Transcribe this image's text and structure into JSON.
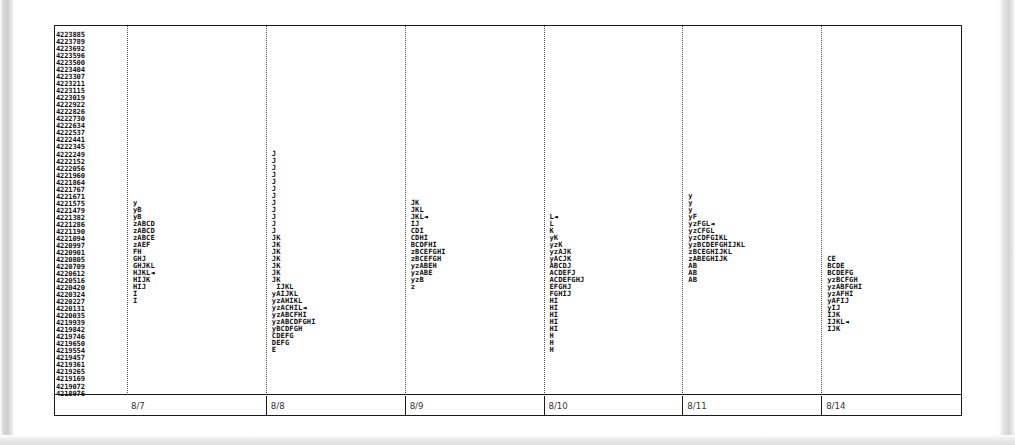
{
  "chart_data": {
    "type": "scatter",
    "title": "",
    "subtitle": "",
    "xlabel": "",
    "ylabel": "",
    "grid": "dotted-vertical",
    "legend": "none",
    "categories": [
      "8/7",
      "8/8",
      "8/9",
      "8/10",
      "8/11",
      "8/14"
    ],
    "y_axis": {
      "type": "numeric-descending",
      "min": 4180014,
      "max": 4223885,
      "step": -96,
      "tick_count": 52,
      "ticks": [
        "4223885",
        "4223789",
        "4223692",
        "4223596",
        "4223500",
        "4223404",
        "4223307",
        "4223211",
        "4223115",
        "4223019",
        "4222922",
        "4222826",
        "4222730",
        "4222634",
        "4222537",
        "4222441",
        "4222345",
        "4222249",
        "4222152",
        "4222056",
        "4221960",
        "4221864",
        "4221767",
        "4221671",
        "4221575",
        "4221479",
        "4221382",
        "4221286",
        "4221190",
        "4221094",
        "4220997",
        "4220901",
        "4220805",
        "4220709",
        "4220612",
        "4220516",
        "4220420",
        "4220324",
        "4220227",
        "4220131",
        "4220035",
        "4219939",
        "4219842",
        "4219746",
        "4219650",
        "4219554",
        "4219457",
        "4219361",
        "4219265",
        "4219169",
        "4219072",
        "4218976",
        "4218880",
        "4218784",
        "4218687",
        "4218591",
        "4218495",
        "4218399",
        "4218302",
        "4218206",
        "4218110",
        "4218014"
      ]
    },
    "marker_note": "◄ arrow marker denotes flagged row",
    "series": [
      {
        "name": "8/7",
        "column_index": 0,
        "points": [
          {
            "row": 24,
            "code": "y"
          },
          {
            "row": 25,
            "code": "yB"
          },
          {
            "row": 26,
            "code": "yB"
          },
          {
            "row": 27,
            "code": "zABCD"
          },
          {
            "row": 28,
            "code": "zABCD"
          },
          {
            "row": 29,
            "code": "zABCE"
          },
          {
            "row": 30,
            "code": "zAEF"
          },
          {
            "row": 31,
            "code": "FH"
          },
          {
            "row": 32,
            "code": "GHJ"
          },
          {
            "row": 33,
            "code": "GHJKL"
          },
          {
            "row": 34,
            "code": "HJKL◄"
          },
          {
            "row": 35,
            "code": "HIJK"
          },
          {
            "row": 36,
            "code": "HIJ"
          },
          {
            "row": 37,
            "code": "I"
          },
          {
            "row": 38,
            "code": "I"
          }
        ]
      },
      {
        "name": "8/8",
        "column_index": 1,
        "points": [
          {
            "row": 17,
            "code": "J"
          },
          {
            "row": 18,
            "code": "J"
          },
          {
            "row": 19,
            "code": "J"
          },
          {
            "row": 20,
            "code": "J"
          },
          {
            "row": 21,
            "code": "J"
          },
          {
            "row": 22,
            "code": "J"
          },
          {
            "row": 23,
            "code": "J"
          },
          {
            "row": 24,
            "code": "J"
          },
          {
            "row": 25,
            "code": "J"
          },
          {
            "row": 26,
            "code": "J"
          },
          {
            "row": 27,
            "code": "J"
          },
          {
            "row": 28,
            "code": "J"
          },
          {
            "row": 29,
            "code": "JK"
          },
          {
            "row": 30,
            "code": "JK"
          },
          {
            "row": 31,
            "code": "JK"
          },
          {
            "row": 32,
            "code": "JK"
          },
          {
            "row": 33,
            "code": "JK"
          },
          {
            "row": 34,
            "code": "JK"
          },
          {
            "row": 35,
            "code": "JK"
          },
          {
            "row": 36,
            "code": " IJKL"
          },
          {
            "row": 37,
            "code": "yAIJKL"
          },
          {
            "row": 38,
            "code": "yzAHIKL"
          },
          {
            "row": 39,
            "code": "yzACHIL◄"
          },
          {
            "row": 40,
            "code": "yzABCFHI"
          },
          {
            "row": 41,
            "code": "yzABCDFGHI"
          },
          {
            "row": 42,
            "code": "yBCDFGH"
          },
          {
            "row": 43,
            "code": "CDEFG"
          },
          {
            "row": 44,
            "code": "DEFG"
          },
          {
            "row": 45,
            "code": "E"
          }
        ]
      },
      {
        "name": "8/9",
        "column_index": 2,
        "points": [
          {
            "row": 24,
            "code": "JK"
          },
          {
            "row": 25,
            "code": "JKL"
          },
          {
            "row": 26,
            "code": "JKL◄"
          },
          {
            "row": 27,
            "code": "IJ"
          },
          {
            "row": 28,
            "code": "CDI"
          },
          {
            "row": 29,
            "code": "CDHI"
          },
          {
            "row": 30,
            "code": "BCDFHI"
          },
          {
            "row": 31,
            "code": "zBCEFGHI"
          },
          {
            "row": 32,
            "code": "zBCEFGH"
          },
          {
            "row": 33,
            "code": "yzABEH"
          },
          {
            "row": 34,
            "code": "yzABE"
          },
          {
            "row": 35,
            "code": "yzB"
          },
          {
            "row": 36,
            "code": "z"
          }
        ]
      },
      {
        "name": "8/10",
        "column_index": 3,
        "points": [
          {
            "row": 26,
            "code": "L◄"
          },
          {
            "row": 27,
            "code": "L"
          },
          {
            "row": 28,
            "code": "K"
          },
          {
            "row": 29,
            "code": "yK"
          },
          {
            "row": 30,
            "code": "yzK"
          },
          {
            "row": 31,
            "code": "yzAJK"
          },
          {
            "row": 32,
            "code": "yACJK"
          },
          {
            "row": 33,
            "code": "ABCDJ"
          },
          {
            "row": 34,
            "code": "ACDEFJ"
          },
          {
            "row": 35,
            "code": "ACDEFGHJ"
          },
          {
            "row": 36,
            "code": "EFGHJ"
          },
          {
            "row": 37,
            "code": "FGHIJ"
          },
          {
            "row": 38,
            "code": "HI"
          },
          {
            "row": 39,
            "code": "HI"
          },
          {
            "row": 40,
            "code": "HI"
          },
          {
            "row": 41,
            "code": "HI"
          },
          {
            "row": 42,
            "code": "HI"
          },
          {
            "row": 43,
            "code": "H"
          },
          {
            "row": 44,
            "code": "H"
          },
          {
            "row": 45,
            "code": "H"
          }
        ]
      },
      {
        "name": "8/11",
        "column_index": 4,
        "points": [
          {
            "row": 23,
            "code": "y"
          },
          {
            "row": 24,
            "code": "y"
          },
          {
            "row": 25,
            "code": "y"
          },
          {
            "row": 26,
            "code": "yF"
          },
          {
            "row": 27,
            "code": "yzFGL◄"
          },
          {
            "row": 28,
            "code": "yzCFGL"
          },
          {
            "row": 29,
            "code": "yzCDFGIKL"
          },
          {
            "row": 30,
            "code": "yzBCDEFGHIJKL"
          },
          {
            "row": 31,
            "code": "zBCEGHIJKL"
          },
          {
            "row": 32,
            "code": "zABEGHIJK"
          },
          {
            "row": 33,
            "code": "AB"
          },
          {
            "row": 34,
            "code": "AB"
          },
          {
            "row": 35,
            "code": "AB"
          }
        ]
      },
      {
        "name": "8/14",
        "column_index": 5,
        "points": [
          {
            "row": 32,
            "code": "CE"
          },
          {
            "row": 33,
            "code": "BCDE"
          },
          {
            "row": 34,
            "code": "BCDEFG"
          },
          {
            "row": 35,
            "code": "yzBCFGH"
          },
          {
            "row": 36,
            "code": "yzABFGHI"
          },
          {
            "row": 37,
            "code": "yzAFHI"
          },
          {
            "row": 38,
            "code": "yAFIJ"
          },
          {
            "row": 39,
            "code": "yIJ"
          },
          {
            "row": 40,
            "code": "IJK"
          },
          {
            "row": 41,
            "code": "IJKL◄"
          },
          {
            "row": 42,
            "code": "IJK"
          }
        ]
      }
    ]
  }
}
